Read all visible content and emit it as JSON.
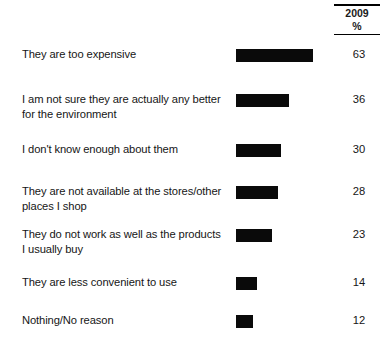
{
  "header": {
    "year_label": "2009",
    "unit_label": "%"
  },
  "chart_data": {
    "type": "bar",
    "title": "",
    "xlabel": "",
    "ylabel": "",
    "orientation": "horizontal",
    "grid": false,
    "legend": false,
    "xlim": [
      0,
      85
    ],
    "unit": "%",
    "column_header": "2009",
    "categories": [
      "They are too expensive",
      "I am not sure they are actually any better for the environment",
      "I don't know enough about them",
      "They are not available at the stores/other places I shop",
      "They do not work as well as the products I usually buy",
      "They are less convenient to use",
      "Nothing/No reason"
    ],
    "values": [
      63,
      36,
      30,
      28,
      23,
      14,
      12
    ]
  },
  "rows": [
    {
      "label_line1": "They are too expensive",
      "label_line2": "",
      "value": "63",
      "bar_pct": 63,
      "bar_width_px": 77,
      "row_height_px": 45
    },
    {
      "label_line1": "I am not sure they are actually any better",
      "label_line2": "for the environment",
      "value": "36",
      "bar_pct": 36,
      "bar_width_px": 53,
      "row_height_px": 50
    },
    {
      "label_line1": "I don't know enough about them",
      "label_line2": "",
      "value": "30",
      "bar_pct": 30,
      "bar_width_px": 45,
      "row_height_px": 42
    },
    {
      "label_line1": "They are not available at the stores/other",
      "label_line2": "places I shop",
      "value": "28",
      "bar_pct": 28,
      "bar_width_px": 42,
      "row_height_px": 43
    },
    {
      "label_line1": "They do not work as well as the products",
      "label_line2": "I usually buy",
      "value": "23",
      "bar_pct": 23,
      "bar_width_px": 36,
      "row_height_px": 48
    },
    {
      "label_line1": "They are less convenient to use",
      "label_line2": "",
      "value": "14",
      "bar_pct": 14,
      "bar_width_px": 21,
      "row_height_px": 38
    },
    {
      "label_line1": "Nothing/No reason",
      "label_line2": "",
      "value": "12",
      "bar_pct": 12,
      "bar_width_px": 17,
      "row_height_px": 36
    }
  ],
  "colors": {
    "bar": "#0a0a0a",
    "text": "#161616",
    "rule": "#000000",
    "background": "#ffffff"
  }
}
